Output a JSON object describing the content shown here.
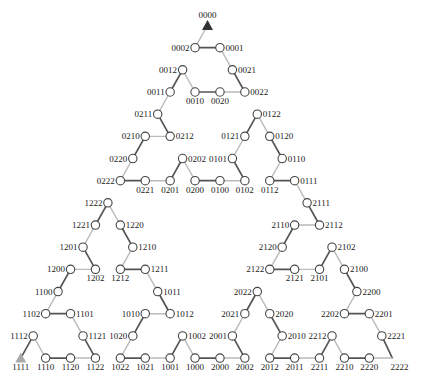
{
  "diagram": {
    "type": "hanoi-graph-path",
    "layout": {
      "origin_x": 207.5,
      "origin_y": 25.5,
      "col_step": 12.45,
      "row_step": 22.17
    },
    "colors": {
      "background": "#ffffff",
      "edge_dark": "#555555",
      "edge_light": "#bbbbbb",
      "node_stroke": "#444444",
      "node_fill": "#ffffff",
      "label": "#222222",
      "start_marker": "#333333",
      "end_marker": "#aaaaaa"
    },
    "start_node": "0000",
    "end_node": "1111",
    "edge_style_rule": "alternating light/dark along path, starting with light"
  },
  "nodes": [
    {
      "label": "0000",
      "row": 0,
      "col": 0,
      "label_pos": "above",
      "marker": "start-triangle"
    },
    {
      "label": "0002",
      "row": 1,
      "col": -1,
      "label_pos": "left",
      "marker": "circle"
    },
    {
      "label": "0001",
      "row": 1,
      "col": 1,
      "label_pos": "right",
      "marker": "circle"
    },
    {
      "label": "0012",
      "row": 2,
      "col": -2,
      "label_pos": "left",
      "marker": "circle"
    },
    {
      "label": "0021",
      "row": 2,
      "col": 2,
      "label_pos": "right",
      "marker": "circle"
    },
    {
      "label": "0011",
      "row": 3,
      "col": -3,
      "label_pos": "left",
      "marker": "circle"
    },
    {
      "label": "0010",
      "row": 3,
      "col": -1,
      "label_pos": "below",
      "marker": "circle"
    },
    {
      "label": "0020",
      "row": 3,
      "col": 1,
      "label_pos": "below",
      "marker": "circle"
    },
    {
      "label": "0022",
      "row": 3,
      "col": 3,
      "label_pos": "right",
      "marker": "circle"
    },
    {
      "label": "0211",
      "row": 4,
      "col": -4,
      "label_pos": "left",
      "marker": "circle"
    },
    {
      "label": "0122",
      "row": 4,
      "col": 4,
      "label_pos": "right",
      "marker": "circle"
    },
    {
      "label": "0210",
      "row": 5,
      "col": -5,
      "label_pos": "left",
      "marker": "circle"
    },
    {
      "label": "0212",
      "row": 5,
      "col": -3,
      "label_pos": "right",
      "marker": "circle"
    },
    {
      "label": "0121",
      "row": 5,
      "col": 3,
      "label_pos": "left",
      "marker": "circle"
    },
    {
      "label": "0120",
      "row": 5,
      "col": 5,
      "label_pos": "right",
      "marker": "circle"
    },
    {
      "label": "0220",
      "row": 6,
      "col": -6,
      "label_pos": "left",
      "marker": "circle"
    },
    {
      "label": "0202",
      "row": 6,
      "col": -2,
      "label_pos": "right",
      "marker": "circle"
    },
    {
      "label": "0101",
      "row": 6,
      "col": 2,
      "label_pos": "left",
      "marker": "circle"
    },
    {
      "label": "0110",
      "row": 6,
      "col": 6,
      "label_pos": "right",
      "marker": "circle"
    },
    {
      "label": "0222",
      "row": 7,
      "col": -7,
      "label_pos": "left",
      "marker": "circle"
    },
    {
      "label": "0221",
      "row": 7,
      "col": -5,
      "label_pos": "below",
      "marker": "circle"
    },
    {
      "label": "0201",
      "row": 7,
      "col": -3,
      "label_pos": "below",
      "marker": "circle"
    },
    {
      "label": "0200",
      "row": 7,
      "col": -1,
      "label_pos": "below",
      "marker": "circle"
    },
    {
      "label": "0100",
      "row": 7,
      "col": 1,
      "label_pos": "below",
      "marker": "circle"
    },
    {
      "label": "0102",
      "row": 7,
      "col": 3,
      "label_pos": "below",
      "marker": "circle"
    },
    {
      "label": "0112",
      "row": 7,
      "col": 5,
      "label_pos": "below",
      "marker": "circle"
    },
    {
      "label": "0111",
      "row": 7,
      "col": 7,
      "label_pos": "right",
      "marker": "circle"
    },
    {
      "label": "1222",
      "row": 8,
      "col": -8,
      "label_pos": "left",
      "marker": "circle"
    },
    {
      "label": "2111",
      "row": 8,
      "col": 8,
      "label_pos": "right",
      "marker": "circle"
    },
    {
      "label": "1221",
      "row": 9,
      "col": -9,
      "label_pos": "left",
      "marker": "circle"
    },
    {
      "label": "1220",
      "row": 9,
      "col": -7,
      "label_pos": "right",
      "marker": "circle"
    },
    {
      "label": "2110",
      "row": 9,
      "col": 7,
      "label_pos": "left",
      "marker": "circle"
    },
    {
      "label": "2112",
      "row": 9,
      "col": 9,
      "label_pos": "right",
      "marker": "circle"
    },
    {
      "label": "1201",
      "row": 10,
      "col": -10,
      "label_pos": "left",
      "marker": "circle"
    },
    {
      "label": "1210",
      "row": 10,
      "col": -6,
      "label_pos": "right",
      "marker": "circle"
    },
    {
      "label": "2120",
      "row": 10,
      "col": 6,
      "label_pos": "left",
      "marker": "circle"
    },
    {
      "label": "2102",
      "row": 10,
      "col": 10,
      "label_pos": "right",
      "marker": "circle"
    },
    {
      "label": "1200",
      "row": 11,
      "col": -11,
      "label_pos": "left",
      "marker": "circle"
    },
    {
      "label": "1202",
      "row": 11,
      "col": -9,
      "label_pos": "below",
      "marker": "circle"
    },
    {
      "label": "1212",
      "row": 11,
      "col": -7,
      "label_pos": "below",
      "marker": "circle"
    },
    {
      "label": "1211",
      "row": 11,
      "col": -5,
      "label_pos": "right",
      "marker": "circle"
    },
    {
      "label": "2122",
      "row": 11,
      "col": 5,
      "label_pos": "left",
      "marker": "circle"
    },
    {
      "label": "2121",
      "row": 11,
      "col": 7,
      "label_pos": "below",
      "marker": "circle"
    },
    {
      "label": "2101",
      "row": 11,
      "col": 9,
      "label_pos": "below",
      "marker": "circle"
    },
    {
      "label": "2100",
      "row": 11,
      "col": 11,
      "label_pos": "right",
      "marker": "circle"
    },
    {
      "label": "1100",
      "row": 12,
      "col": -12,
      "label_pos": "left",
      "marker": "circle"
    },
    {
      "label": "1011",
      "row": 12,
      "col": -4,
      "label_pos": "right",
      "marker": "circle"
    },
    {
      "label": "2022",
      "row": 12,
      "col": 4,
      "label_pos": "left",
      "marker": "circle"
    },
    {
      "label": "2200",
      "row": 12,
      "col": 12,
      "label_pos": "right",
      "marker": "circle"
    },
    {
      "label": "1102",
      "row": 13,
      "col": -13,
      "label_pos": "left",
      "marker": "circle"
    },
    {
      "label": "1101",
      "row": 13,
      "col": -11,
      "label_pos": "right",
      "marker": "circle"
    },
    {
      "label": "1010",
      "row": 13,
      "col": -5,
      "label_pos": "left",
      "marker": "circle"
    },
    {
      "label": "1012",
      "row": 13,
      "col": -3,
      "label_pos": "right",
      "marker": "circle"
    },
    {
      "label": "2021",
      "row": 13,
      "col": 3,
      "label_pos": "left",
      "marker": "circle"
    },
    {
      "label": "2020",
      "row": 13,
      "col": 5,
      "label_pos": "right",
      "marker": "circle"
    },
    {
      "label": "2202",
      "row": 13,
      "col": 11,
      "label_pos": "left",
      "marker": "circle"
    },
    {
      "label": "2201",
      "row": 13,
      "col": 13,
      "label_pos": "right",
      "marker": "circle"
    },
    {
      "label": "1112",
      "row": 14,
      "col": -14,
      "label_pos": "left",
      "marker": "circle"
    },
    {
      "label": "1121",
      "row": 14,
      "col": -10,
      "label_pos": "right",
      "marker": "circle"
    },
    {
      "label": "1020",
      "row": 14,
      "col": -6,
      "label_pos": "left",
      "marker": "circle"
    },
    {
      "label": "1002",
      "row": 14,
      "col": -2,
      "label_pos": "right",
      "marker": "circle"
    },
    {
      "label": "2001",
      "row": 14,
      "col": 2,
      "label_pos": "left",
      "marker": "circle"
    },
    {
      "label": "2010",
      "row": 14,
      "col": 6,
      "label_pos": "right",
      "marker": "circle"
    },
    {
      "label": "2212",
      "row": 14,
      "col": 10,
      "label_pos": "left",
      "marker": "circle"
    },
    {
      "label": "2221",
      "row": 14,
      "col": 14,
      "label_pos": "right",
      "marker": "circle"
    },
    {
      "label": "1111",
      "row": 15,
      "col": -15,
      "label_pos": "below",
      "marker": "end-triangle"
    },
    {
      "label": "1110",
      "row": 15,
      "col": -13,
      "label_pos": "below",
      "marker": "circle"
    },
    {
      "label": "1120",
      "row": 15,
      "col": -11,
      "label_pos": "below",
      "marker": "circle"
    },
    {
      "label": "1122",
      "row": 15,
      "col": -9,
      "label_pos": "below",
      "marker": "circle"
    },
    {
      "label": "1022",
      "row": 15,
      "col": -7,
      "label_pos": "below",
      "marker": "circle"
    },
    {
      "label": "1021",
      "row": 15,
      "col": -5,
      "label_pos": "below",
      "marker": "circle"
    },
    {
      "label": "1001",
      "row": 15,
      "col": -3,
      "label_pos": "below",
      "marker": "circle"
    },
    {
      "label": "1000",
      "row": 15,
      "col": -1,
      "label_pos": "below",
      "marker": "circle"
    },
    {
      "label": "2000",
      "row": 15,
      "col": 1,
      "label_pos": "below",
      "marker": "circle"
    },
    {
      "label": "2002",
      "row": 15,
      "col": 3,
      "label_pos": "below",
      "marker": "circle"
    },
    {
      "label": "2012",
      "row": 15,
      "col": 5,
      "label_pos": "below",
      "marker": "circle"
    },
    {
      "label": "2011",
      "row": 15,
      "col": 7,
      "label_pos": "below",
      "marker": "circle"
    },
    {
      "label": "2211",
      "row": 15,
      "col": 9,
      "label_pos": "below",
      "marker": "circle"
    },
    {
      "label": "2210",
      "row": 15,
      "col": 11,
      "label_pos": "below",
      "marker": "circle"
    },
    {
      "label": "2220",
      "row": 15,
      "col": 13,
      "label_pos": "below",
      "marker": "circle"
    },
    {
      "label": "2222",
      "row": 15,
      "col": 14.85,
      "label_pos": "below",
      "marker": "none",
      "label_dx": 7
    }
  ],
  "path": [
    "0000",
    "0002",
    "0001",
    "0021",
    "0022",
    "0020",
    "0010",
    "0012",
    "0011",
    "0211",
    "0212",
    "0210",
    "0220",
    "0222",
    "0221",
    "0201",
    "0202",
    "0200",
    "0100",
    "0102",
    "0101",
    "0121",
    "0122",
    "0120",
    "0110",
    "0112",
    "0111",
    "2111",
    "2112",
    "2110",
    "2120",
    "2122",
    "2121",
    "2101",
    "2102",
    "2100",
    "2200",
    "2202",
    "2201",
    "2221",
    "2222",
    "2220",
    "2210",
    "2212",
    "2211",
    "2011",
    "2012",
    "2010",
    "2020",
    "2022",
    "2021",
    "2001",
    "2002",
    "2000",
    "1000",
    "1002",
    "1001",
    "1021",
    "1022",
    "1020",
    "1010",
    "1012",
    "1011",
    "1211",
    "1212",
    "1210",
    "1220",
    "1222",
    "1221",
    "1201",
    "1202",
    "1200",
    "1100",
    "1102",
    "1101",
    "1121",
    "1122",
    "1120",
    "1110",
    "1112",
    "1111"
  ]
}
